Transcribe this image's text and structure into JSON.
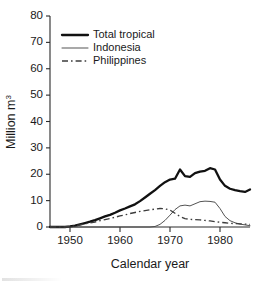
{
  "chart_data": {
    "type": "line",
    "title": "",
    "xlabel": "Calendar year",
    "ylabel": "Million m3",
    "ylabel_text": "Million m",
    "ylabel_superscript": "3",
    "xlim": [
      1946,
      1986
    ],
    "ylim": [
      0,
      80
    ],
    "xticks": [
      1950,
      1960,
      1970,
      1980
    ],
    "yticks": [
      0,
      10,
      20,
      30,
      40,
      50,
      60,
      70,
      80
    ],
    "xtick_labels": [
      "1950",
      "1960",
      "1970",
      "1980"
    ],
    "ytick_labels": [
      "0",
      "10",
      "20",
      "30",
      "40",
      "50",
      "60",
      "70",
      "80"
    ],
    "grid": false,
    "legend_position": "top-left",
    "x": [
      1946,
      1947,
      1948,
      1949,
      1950,
      1951,
      1952,
      1953,
      1954,
      1955,
      1956,
      1957,
      1958,
      1959,
      1960,
      1961,
      1962,
      1963,
      1964,
      1965,
      1966,
      1967,
      1968,
      1969,
      1970,
      1971,
      1972,
      1973,
      1974,
      1975,
      1976,
      1977,
      1978,
      1979,
      1980,
      1981,
      1982,
      1983,
      1984,
      1985,
      1986
    ],
    "series": [
      {
        "name": "Total tropical",
        "style": "thick-solid",
        "color": "#111111",
        "values": [
          0,
          0,
          0,
          0,
          0.2,
          0.5,
          1.0,
          1.5,
          2.0,
          2.6,
          3.3,
          4.0,
          4.6,
          5.4,
          6.3,
          7.0,
          7.8,
          8.6,
          9.8,
          11.2,
          12.6,
          14.0,
          15.6,
          17.0,
          18.0,
          18.3,
          21.8,
          19.3,
          19.0,
          20.4,
          21.0,
          21.3,
          22.3,
          21.8,
          18.0,
          15.6,
          14.5,
          14.0,
          13.6,
          13.3,
          14.2
        ]
      },
      {
        "name": "Indonesia",
        "style": "thin-solid",
        "color": "#4a4a4a",
        "values": [
          0,
          0,
          0,
          0,
          0,
          0,
          0,
          0,
          0,
          0,
          0,
          0,
          0,
          0,
          0,
          0,
          0,
          0,
          0,
          0,
          0,
          0.2,
          1.0,
          2.5,
          4.5,
          6.6,
          8.0,
          8.3,
          8.0,
          8.8,
          9.6,
          9.8,
          9.7,
          9.4,
          7.0,
          4.0,
          2.4,
          1.6,
          1.1,
          0.8,
          0.5
        ]
      },
      {
        "name": "Philippines",
        "style": "dash-dot",
        "color": "#3c3c3c",
        "values": [
          0,
          0,
          0,
          0,
          0.2,
          0.4,
          0.8,
          1.2,
          1.6,
          1.9,
          2.4,
          2.8,
          3.2,
          3.7,
          4.2,
          4.6,
          5.1,
          5.5,
          5.9,
          6.2,
          6.5,
          6.8,
          7.0,
          6.9,
          6.4,
          5.2,
          4.0,
          3.2,
          2.9,
          2.8,
          2.7,
          2.5,
          2.3,
          2.0,
          1.8,
          1.6,
          1.4,
          1.3,
          1.2,
          1.1,
          1.0
        ]
      }
    ],
    "legend": [
      {
        "label": "Total tropical",
        "style": "thick-solid"
      },
      {
        "label": "Indonesia",
        "style": "thin-solid"
      },
      {
        "label": "Philippines",
        "style": "dash-dot"
      }
    ]
  }
}
